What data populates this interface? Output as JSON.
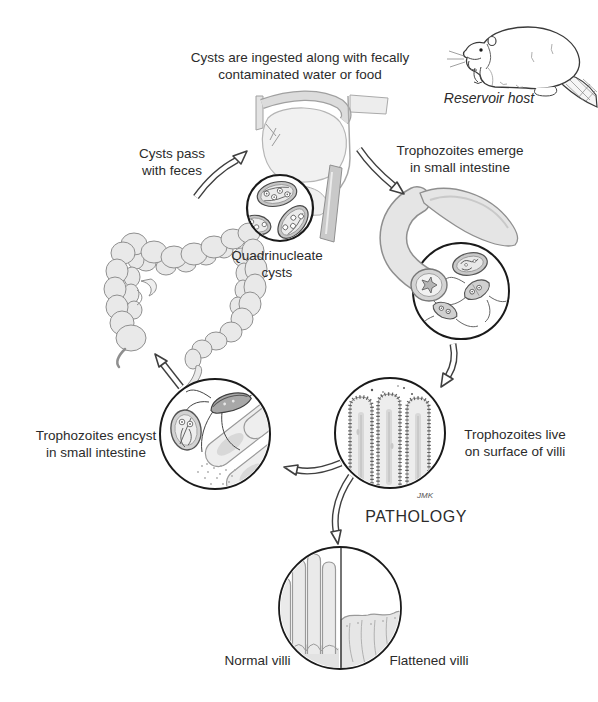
{
  "labels": {
    "ingestion": "Cysts are ingested along with fecally\ncontaminated water or food",
    "reservoir_host": "Reservoir host",
    "cysts_pass": "Cysts pass\nwith feces",
    "quadrinucleate_cysts": "Quadrinucleate\ncysts",
    "trophozoites_emerge": "Trophozoites emerge\nin small intestine",
    "trophozoites_live": "Trophozoites live\non surface of villi",
    "trophozoites_encyst": "Trophozoites encyst\nin small intestine",
    "pathology": "PATHOLOGY",
    "normal_villi": "Normal villi",
    "flattened_villi": "Flattened villi",
    "signature": "JMK"
  },
  "colors": {
    "ink": "#2b2b2b",
    "outline": "#3f3f3f",
    "illustration_fill": "#ececec",
    "background": "#ffffff"
  }
}
